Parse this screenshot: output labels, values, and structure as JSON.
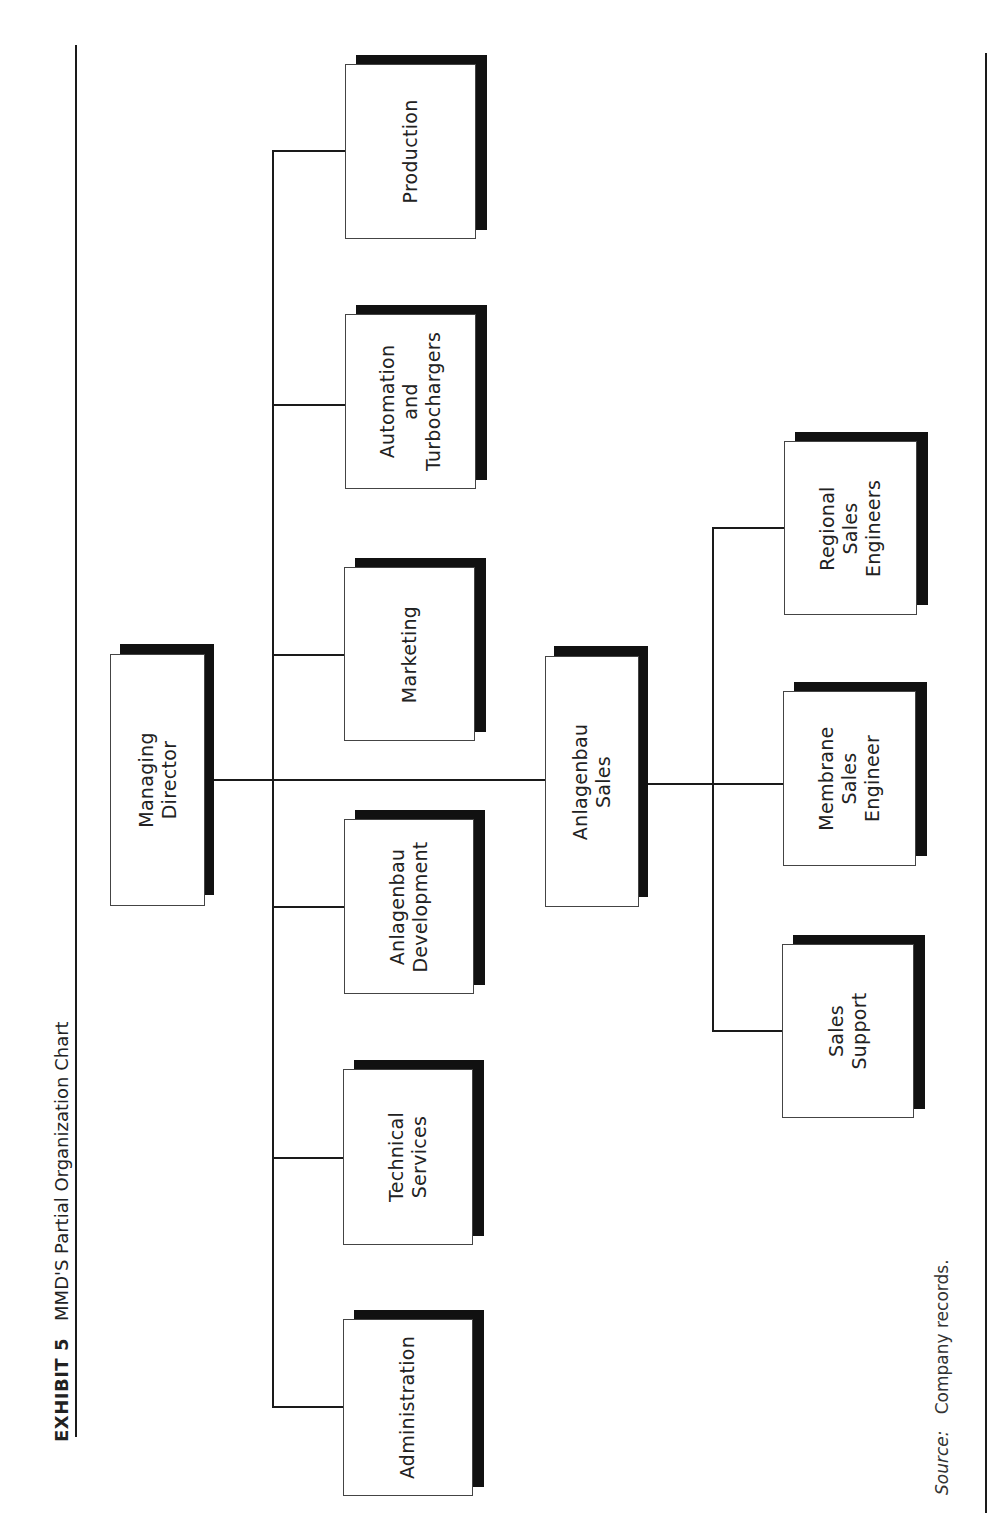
{
  "title": {
    "exhibit": "EXHIBIT 5",
    "text": "MMD'S Partial Organization Chart"
  },
  "source": {
    "label": "Source:",
    "text": "Company records."
  },
  "org_chart": {
    "root": {
      "id": "managing_director",
      "label": "Managing Director"
    },
    "departments": [
      {
        "id": "production",
        "label": "Production"
      },
      {
        "id": "automation",
        "label": "Automation\nand\nTurbochargers"
      },
      {
        "id": "marketing",
        "label": "Marketing"
      },
      {
        "id": "anlagenbau_development",
        "label": "Anlagenbau\nDevelopment"
      },
      {
        "id": "technical_services",
        "label": "Technical\nServices"
      },
      {
        "id": "administration",
        "label": "Administration"
      }
    ],
    "sales": {
      "id": "anlagenbau_sales",
      "label": "Anlagenbau\nSales"
    },
    "sales_units": [
      {
        "id": "regional_sales_engineers",
        "label": "Regional\nSales\nEngineers"
      },
      {
        "id": "membrane_sales_engineer",
        "label": "Membrane\nSales\nEngineer"
      },
      {
        "id": "sales_support",
        "label": "Sales\nSupport"
      }
    ]
  },
  "colors": {
    "line": "#1a1a1a",
    "shadow": "#111111",
    "box_fill": "#ffffff"
  }
}
